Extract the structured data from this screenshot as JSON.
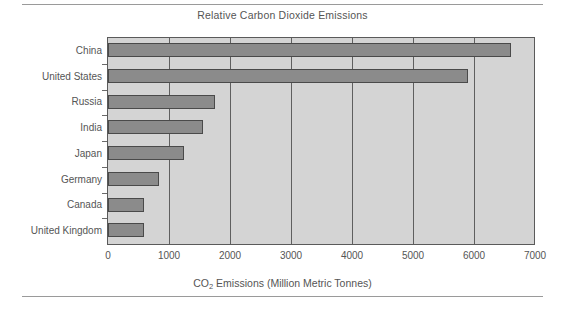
{
  "chart_data": {
    "type": "bar",
    "orientation": "horizontal",
    "title": "Relative Carbon Dioxide Emissions",
    "xlabel_prefix": "CO",
    "xlabel_sub": "2",
    "xlabel_suffix": " Emissions (Million Metric Tonnes)",
    "xlabel": "CO2 Emissions (Million Metric Tonnes)",
    "ylabel": "",
    "categories": [
      "China",
      "United States",
      "Russia",
      "India",
      "Japan",
      "Germany",
      "Canada",
      "United Kingdom"
    ],
    "values": [
      6600,
      5900,
      1750,
      1550,
      1250,
      830,
      590,
      590
    ],
    "xlim": [
      0,
      7000
    ],
    "xticks": [
      0,
      1000,
      2000,
      3000,
      4000,
      5000,
      6000,
      7000
    ],
    "xtick_labels": [
      "0",
      "1000",
      "2000",
      "3000",
      "4000",
      "5000",
      "6000",
      "7000"
    ],
    "grid": "vertical",
    "legend": "none",
    "bar_color": "#8b8b8b",
    "bar_border_color": "#4a4a4a",
    "plot_background": "#d4d4d4",
    "page_background": "#ffffff",
    "text_color": "#555555"
  }
}
